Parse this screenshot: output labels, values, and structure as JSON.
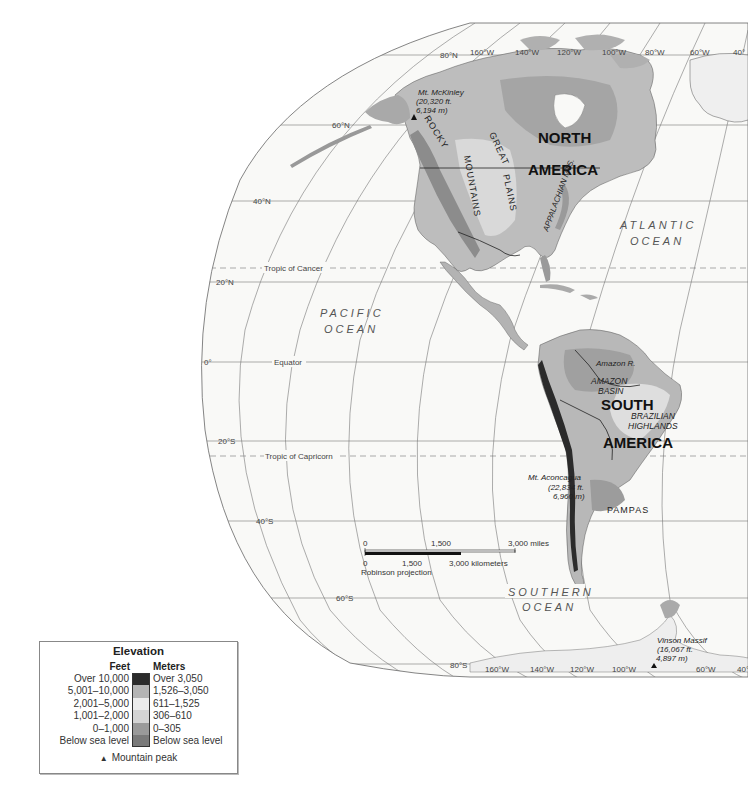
{
  "map": {
    "projection": "Robinson projection",
    "graticule": {
      "latitudes": [
        "80°N",
        "60°N",
        "40°N",
        "20°N",
        "0°",
        "20°S",
        "40°S",
        "60°S",
        "80°S"
      ],
      "longitudes_top": [
        "160°W",
        "140°W",
        "120°W",
        "100°W",
        "80°W",
        "60°W",
        "40°"
      ],
      "longitudes_bottom": [
        "160°W",
        "140°W",
        "120°W",
        "100°W",
        "60°W",
        "40°"
      ]
    },
    "special_lines": {
      "tropic_of_cancer": "Tropic of Cancer",
      "equator": "Equator",
      "tropic_of_capricorn": "Tropic of Capricorn"
    },
    "continents": {
      "north_america_line1": "NORTH",
      "north_america_line2": "AMERICA",
      "south_america_line1": "SOUTH",
      "south_america_line2": "AMERICA"
    },
    "oceans": {
      "pacific_line1": "PACIFIC",
      "pacific_line2": "OCEAN",
      "atlantic_line1": "ATLANTIC",
      "atlantic_line2": "OCEAN",
      "southern_line1": "SOUTHERN",
      "southern_line2": "OCEAN"
    },
    "regions": {
      "rocky_line1": "ROCKY",
      "rocky_line2": "MOUNTAINS",
      "great_plains_line1": "GREAT",
      "great_plains_line2": "PLAINS",
      "appalachian": "APPALACHIAN MTS.",
      "amazon_river": "Amazon R.",
      "amazon_basin_line1": "AMAZON",
      "amazon_basin_line2": "BASIN",
      "brazilian_line1": "BRAZILIAN",
      "brazilian_line2": "HIGHLANDS",
      "pampas": "PAMPAS"
    },
    "peaks": [
      {
        "name": "Mt. McKinley",
        "elev_ft": "(20,320 ft.",
        "elev_m": "6,194 m)"
      },
      {
        "name": "Mt. Aconcagua",
        "elev_ft": "(22,834 ft.",
        "elev_m": "6,960 m)"
      },
      {
        "name": "Vinson Massif",
        "elev_ft": "(16,067 ft.",
        "elev_m": "4,897 m)"
      }
    ],
    "scale_bar": {
      "miles": [
        "0",
        "1,500",
        "3,000 miles"
      ],
      "km": [
        "0",
        "1,500",
        "3,000 kilometers"
      ],
      "projection_label": "Robinson projection"
    }
  },
  "legend": {
    "title": "Elevation",
    "feet_header": "Feet",
    "meters_header": "Meters",
    "rows": [
      {
        "feet": "Over 10,000",
        "meters": "Over 3,050",
        "color": "#2b2b2b"
      },
      {
        "feet": "5,001–10,000",
        "meters": "1,526–3,050",
        "color": "#b4b4b4"
      },
      {
        "feet": "2,001–5,000",
        "meters": "611–1,525",
        "color": "#ececec"
      },
      {
        "feet": "1,001–2,000",
        "meters": "306–610",
        "color": "#d4d4d4"
      },
      {
        "feet": "0–1,000",
        "meters": "0–305",
        "color": "#9a9a9a"
      },
      {
        "feet": "Below sea level",
        "meters": "Below sea level",
        "color": "#7a7a7a"
      }
    ],
    "peak_symbol": "▲",
    "peak_label": "Mountain peak"
  }
}
